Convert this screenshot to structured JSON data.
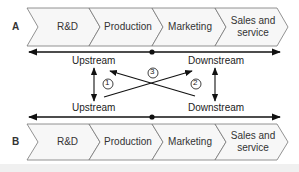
{
  "diagram": {
    "rows": [
      {
        "letter": "A",
        "segments": [
          "R&D",
          "Production",
          "Marketing",
          "Sales and service"
        ],
        "segments_display": [
          [
            "R&D"
          ],
          [
            "Production"
          ],
          [
            "Marketing"
          ],
          [
            "Sales and",
            "service"
          ]
        ]
      },
      {
        "letter": "B",
        "segments": [
          "R&D",
          "Production",
          "Marketing",
          "Sales and service"
        ],
        "segments_display": [
          [
            "R&D"
          ],
          [
            "Production"
          ],
          [
            "Marketing"
          ],
          [
            "Sales and",
            "service"
          ]
        ]
      }
    ],
    "labels": {
      "top_left": "Upstream",
      "top_right": "Downstream",
      "bottom_left": "Upstream",
      "bottom_right": "Downstream"
    },
    "markers": [
      "1",
      "2",
      "3"
    ],
    "colors": {
      "chevron_fill": "#f7f7f7",
      "chevron_stroke": "#666666",
      "arrow": "#111111",
      "text": "#333333"
    }
  }
}
